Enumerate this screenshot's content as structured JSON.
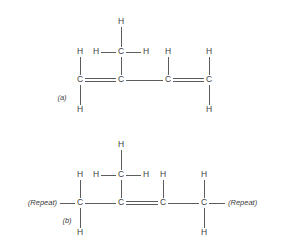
{
  "figure": {
    "background_color": "#ffffff",
    "line_color": "#4a4a4a",
    "text_color": "#3d3d3d"
  },
  "structures": [
    {
      "id": "structure-a",
      "label": "(a)",
      "label_pos": {
        "x": 62,
        "y": 98
      },
      "atoms": [
        {
          "name": "c1",
          "symbol": "C",
          "x": 80,
          "y": 80
        },
        {
          "name": "c2",
          "symbol": "C",
          "x": 121,
          "y": 80
        },
        {
          "name": "c3",
          "symbol": "C",
          "x": 168,
          "y": 80
        },
        {
          "name": "c4",
          "symbol": "C",
          "x": 209,
          "y": 80
        },
        {
          "name": "c1-h-up",
          "symbol": "H",
          "x": 80,
          "y": 52
        },
        {
          "name": "c1-h-down",
          "symbol": "H",
          "x": 80,
          "y": 110
        },
        {
          "name": "methyl-c",
          "symbol": "C",
          "x": 121,
          "y": 52
        },
        {
          "name": "methyl-h-up",
          "symbol": "H",
          "x": 121,
          "y": 22
        },
        {
          "name": "methyl-h-left",
          "symbol": "H",
          "x": 96,
          "y": 52
        },
        {
          "name": "methyl-h-right",
          "symbol": "H",
          "x": 146,
          "y": 52
        },
        {
          "name": "c3-h-up",
          "symbol": "H",
          "x": 168,
          "y": 52
        },
        {
          "name": "c4-h-up",
          "symbol": "H",
          "x": 209,
          "y": 52
        },
        {
          "name": "c4-h-down",
          "symbol": "H",
          "x": 209,
          "y": 110
        }
      ],
      "bonds": [
        {
          "name": "bond-c1-c2",
          "order": 2,
          "x1": 80,
          "y1": 80,
          "x2": 121,
          "y2": 80
        },
        {
          "name": "bond-c2-c3",
          "order": 1,
          "x1": 121,
          "y1": 80,
          "x2": 168,
          "y2": 80
        },
        {
          "name": "bond-c3-c4",
          "order": 2,
          "x1": 168,
          "y1": 80,
          "x2": 209,
          "y2": 80
        },
        {
          "name": "bond-c1-hup",
          "order": 1,
          "x1": 80,
          "y1": 80,
          "x2": 80,
          "y2": 52
        },
        {
          "name": "bond-c1-hdown",
          "order": 1,
          "x1": 80,
          "y1": 80,
          "x2": 80,
          "y2": 110
        },
        {
          "name": "bond-c2-methyl",
          "order": 1,
          "x1": 121,
          "y1": 80,
          "x2": 121,
          "y2": 52
        },
        {
          "name": "bond-methyl-hup",
          "order": 1,
          "x1": 121,
          "y1": 52,
          "x2": 121,
          "y2": 22
        },
        {
          "name": "bond-methyl-hleft",
          "order": 1,
          "x1": 121,
          "y1": 52,
          "x2": 96,
          "y2": 52
        },
        {
          "name": "bond-methyl-hright",
          "order": 1,
          "x1": 121,
          "y1": 52,
          "x2": 146,
          "y2": 52
        },
        {
          "name": "bond-c3-hup",
          "order": 1,
          "x1": 168,
          "y1": 80,
          "x2": 168,
          "y2": 52
        },
        {
          "name": "bond-c4-hup",
          "order": 1,
          "x1": 209,
          "y1": 80,
          "x2": 209,
          "y2": 52
        },
        {
          "name": "bond-c4-hdown",
          "order": 1,
          "x1": 209,
          "y1": 80,
          "x2": 209,
          "y2": 110
        }
      ]
    },
    {
      "id": "structure-b",
      "label": "(b)",
      "label_pos": {
        "x": 67,
        "y": 221
      },
      "repeat_left": {
        "text": "(Repeat)",
        "x": 57,
        "y": 203
      },
      "repeat_right": {
        "text": "(Repeat)",
        "x": 228,
        "y": 203
      },
      "atoms": [
        {
          "name": "c1",
          "symbol": "C",
          "x": 80,
          "y": 203
        },
        {
          "name": "c2",
          "symbol": "C",
          "x": 121,
          "y": 203
        },
        {
          "name": "c3",
          "symbol": "C",
          "x": 163,
          "y": 203
        },
        {
          "name": "c4",
          "symbol": "C",
          "x": 204,
          "y": 203
        },
        {
          "name": "c1-h-up",
          "symbol": "H",
          "x": 80,
          "y": 175
        },
        {
          "name": "c1-h-down",
          "symbol": "H",
          "x": 80,
          "y": 233
        },
        {
          "name": "methyl-c",
          "symbol": "C",
          "x": 121,
          "y": 175
        },
        {
          "name": "methyl-h-up",
          "symbol": "H",
          "x": 121,
          "y": 145
        },
        {
          "name": "methyl-h-left",
          "symbol": "H",
          "x": 96,
          "y": 175
        },
        {
          "name": "methyl-h-right",
          "symbol": "H",
          "x": 146,
          "y": 175
        },
        {
          "name": "c3-h-up",
          "symbol": "H",
          "x": 163,
          "y": 175
        },
        {
          "name": "c4-h-up",
          "symbol": "H",
          "x": 204,
          "y": 175
        },
        {
          "name": "c4-h-down",
          "symbol": "H",
          "x": 204,
          "y": 233
        }
      ],
      "bonds": [
        {
          "name": "bond-repeatleft-c1",
          "order": 1,
          "x1": 60,
          "y1": 203,
          "x2": 80,
          "y2": 203
        },
        {
          "name": "bond-c1-c2",
          "order": 1,
          "x1": 80,
          "y1": 203,
          "x2": 121,
          "y2": 203
        },
        {
          "name": "bond-c2-c3",
          "order": 2,
          "x1": 121,
          "y1": 203,
          "x2": 163,
          "y2": 203
        },
        {
          "name": "bond-c3-c4",
          "order": 1,
          "x1": 163,
          "y1": 203,
          "x2": 204,
          "y2": 203
        },
        {
          "name": "bond-c4-repeatright",
          "order": 1,
          "x1": 204,
          "y1": 203,
          "x2": 225,
          "y2": 203
        },
        {
          "name": "bond-c1-hup",
          "order": 1,
          "x1": 80,
          "y1": 203,
          "x2": 80,
          "y2": 175
        },
        {
          "name": "bond-c1-hdown",
          "order": 1,
          "x1": 80,
          "y1": 203,
          "x2": 80,
          "y2": 233
        },
        {
          "name": "bond-c2-methyl",
          "order": 1,
          "x1": 121,
          "y1": 203,
          "x2": 121,
          "y2": 175
        },
        {
          "name": "bond-methyl-hup",
          "order": 1,
          "x1": 121,
          "y1": 175,
          "x2": 121,
          "y2": 145
        },
        {
          "name": "bond-methyl-hleft",
          "order": 1,
          "x1": 121,
          "y1": 175,
          "x2": 96,
          "y2": 175
        },
        {
          "name": "bond-methyl-hright",
          "order": 1,
          "x1": 121,
          "y1": 175,
          "x2": 146,
          "y2": 175
        },
        {
          "name": "bond-c3-hup",
          "order": 1,
          "x1": 163,
          "y1": 203,
          "x2": 163,
          "y2": 175
        },
        {
          "name": "bond-c4-hup",
          "order": 1,
          "x1": 204,
          "y1": 203,
          "x2": 204,
          "y2": 175
        },
        {
          "name": "bond-c4-hdown",
          "order": 1,
          "x1": 204,
          "y1": 203,
          "x2": 204,
          "y2": 233
        }
      ]
    }
  ]
}
